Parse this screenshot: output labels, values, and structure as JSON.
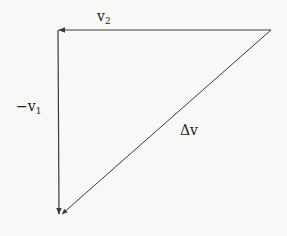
{
  "diagram": {
    "colors": {
      "line": "#3a3a3a",
      "background": "#f8f8f7",
      "text": "#222222"
    },
    "points": {
      "top_left": [
        58,
        30
      ],
      "top_right": [
        271,
        30
      ],
      "bottom": [
        60,
        215
      ]
    },
    "vectors": [
      {
        "id": "v2",
        "from": "top_right",
        "to": "top_left",
        "label": "v",
        "subscript": "2",
        "label_pos": [
          97,
          8
        ]
      },
      {
        "id": "neg_v1",
        "from": "top_left",
        "to": "bottom",
        "label": "−v",
        "subscript": "1",
        "label_pos": [
          16,
          98
        ]
      },
      {
        "id": "delta_v",
        "from": "top_right",
        "to": "bottom",
        "label": "Δv",
        "subscript": "",
        "label_pos": [
          180,
          122
        ]
      }
    ]
  }
}
